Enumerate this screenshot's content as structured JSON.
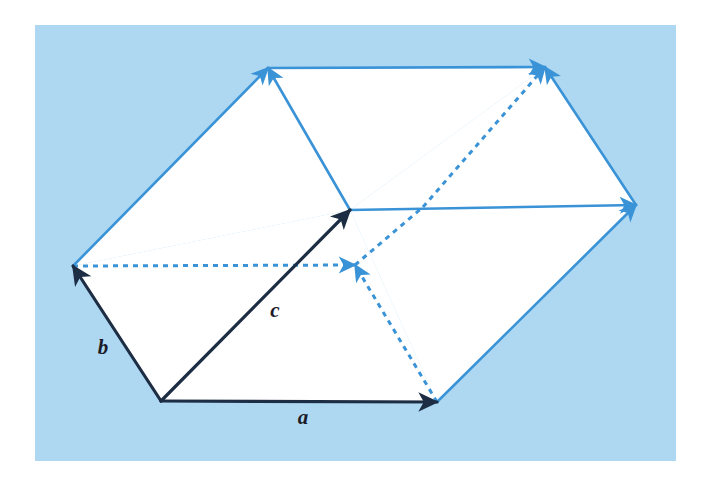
{
  "figure": {
    "kind": "geometric-vector-diagram",
    "canvas": {
      "width": 712,
      "height": 488
    },
    "panel": {
      "name": "figure-panel",
      "x": 35,
      "y": 25,
      "width": 641,
      "height": 436,
      "fill": "#aed8f2"
    },
    "colors": {
      "background": "#ffffff",
      "panel_fill": "#aed8f2",
      "face_fill": "#ffffff",
      "dark_vector": "#1d2d44",
      "blue_vector": "#3a93d6",
      "dashed_blue": "#3a93d6",
      "label_text": "#1b1b28"
    },
    "labels": [
      {
        "id": "a",
        "text": "a",
        "x": 303,
        "y": 424,
        "describes": "vector-a"
      },
      {
        "id": "b",
        "text": "b",
        "x": 103,
        "y": 354,
        "describes": "vector-b"
      },
      {
        "id": "c",
        "text": "c",
        "x": 275,
        "y": 317,
        "describes": "vector-c"
      }
    ],
    "points": {
      "origin": {
        "x": 161,
        "y": 401
      },
      "a_tip": {
        "x": 437,
        "y": 402
      },
      "b_tip": {
        "x": 73,
        "y": 266
      },
      "c_tip": {
        "x": 350,
        "y": 210
      },
      "top_left": {
        "x": 268,
        "y": 68
      },
      "top_right": {
        "x": 545,
        "y": 67
      },
      "right_mid": {
        "x": 636,
        "y": 205
      },
      "hidden_vertex": {
        "x": 355,
        "y": 265
      },
      "right_lower": {
        "x": 636,
        "y": 205
      }
    },
    "faces": [
      {
        "name": "face-front-bottom",
        "polygon": "161,401 437,402 350,210 73,266",
        "fill": "#ffffff"
      },
      {
        "name": "face-left-upper",
        "polygon": "73,266 350,210 545,67 268,68",
        "fill": "#ffffff"
      },
      {
        "name": "face-right-upper",
        "polygon": "350,210 437,402 636,205 545,67",
        "fill": "#ffffff"
      }
    ],
    "vectors": [
      {
        "name": "vector-a",
        "label": "a",
        "style": "solid",
        "color": "#1d2d44",
        "from": {
          "x": 161,
          "y": 401
        },
        "to": {
          "x": 437,
          "y": 402
        },
        "arrow": true,
        "width": 3.2
      },
      {
        "name": "vector-b",
        "label": "b",
        "style": "solid",
        "color": "#1d2d44",
        "from": {
          "x": 161,
          "y": 401
        },
        "to": {
          "x": 73,
          "y": 266
        },
        "arrow": true,
        "width": 3.2
      },
      {
        "name": "vector-c",
        "label": "c",
        "style": "solid",
        "color": "#1d2d44",
        "from": {
          "x": 161,
          "y": 401
        },
        "to": {
          "x": 350,
          "y": 210
        },
        "arrow": true,
        "width": 3.2
      }
    ],
    "blue_edges": [
      {
        "name": "edge-b-to-topleft",
        "style": "solid",
        "color": "#3a93d6",
        "from": {
          "x": 73,
          "y": 266
        },
        "to": {
          "x": 268,
          "y": 68
        },
        "arrow": true,
        "width": 2.6
      },
      {
        "name": "edge-c-to-topleft",
        "style": "solid",
        "color": "#3a93d6",
        "from": {
          "x": 350,
          "y": 210
        },
        "to": {
          "x": 268,
          "y": 68
        },
        "arrow": true,
        "width": 2.6
      },
      {
        "name": "edge-topleft-to-topright",
        "style": "solid",
        "color": "#3a93d6",
        "from": {
          "x": 268,
          "y": 68
        },
        "to": {
          "x": 545,
          "y": 67
        },
        "arrow": true,
        "width": 2.6
      },
      {
        "name": "edge-rightmid-to-topright",
        "style": "solid",
        "color": "#3a93d6",
        "from": {
          "x": 636,
          "y": 205
        },
        "to": {
          "x": 545,
          "y": 67
        },
        "arrow": true,
        "width": 2.6
      },
      {
        "name": "edge-c-to-rightmid",
        "style": "solid",
        "color": "#3a93d6",
        "from": {
          "x": 350,
          "y": 210
        },
        "to": {
          "x": 636,
          "y": 205
        },
        "arrow": true,
        "width": 2.6
      },
      {
        "name": "edge-atip-to-rightmid",
        "style": "solid",
        "color": "#3a93d6",
        "from": {
          "x": 437,
          "y": 402
        },
        "to": {
          "x": 636,
          "y": 205
        },
        "arrow": true,
        "width": 2.6
      }
    ],
    "dashed_edges": [
      {
        "name": "dashed-btip-to-hidden",
        "style": "dashed",
        "color": "#3a93d6",
        "from": {
          "x": 73,
          "y": 266
        },
        "to": {
          "x": 355,
          "y": 265
        },
        "arrow": true,
        "width": 3.0,
        "dash": "5,5"
      },
      {
        "name": "dashed-hidden-to-topright",
        "style": "dashed",
        "color": "#3a93d6",
        "from": {
          "x": 423,
          "y": 207
        },
        "to": {
          "x": 545,
          "y": 67
        },
        "arrow": true,
        "width": 3.0,
        "dash": "5,5"
      },
      {
        "name": "dashed-atip-to-hidden",
        "style": "dashed",
        "color": "#3a93d6",
        "from": {
          "x": 437,
          "y": 402
        },
        "to": {
          "x": 355,
          "y": 265
        },
        "arrow": true,
        "width": 3.0,
        "dash": "5,5"
      },
      {
        "name": "dashed-hidden-to-upper-right",
        "style": "dashed",
        "color": "#3a93d6",
        "from": {
          "x": 355,
          "y": 265
        },
        "to": {
          "x": 423,
          "y": 207
        },
        "arrow": false,
        "width": 3.0,
        "dash": "5,5"
      }
    ]
  }
}
